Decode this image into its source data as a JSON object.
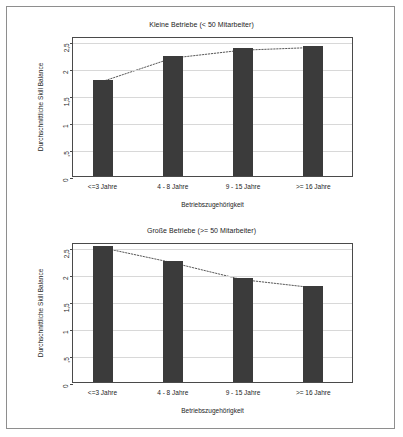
{
  "figure": {
    "background_color": "#ffffff",
    "frame_color": "#8e8e8e",
    "bar_color": "#3b3b3b",
    "grid_color": "#d8d8d8",
    "axis_color": "#4a4a4a"
  },
  "chart_data": [
    {
      "type": "bar",
      "title": "Kleine Betriebe (< 50 Mitarbeiter)",
      "xlabel": "Betriebszugehörigkeit",
      "ylabel": "Durchschnittliche Skill Balance",
      "categories": [
        "<=3  Jahre",
        "4 - 8   Jahre",
        "9 - 15   Jahre",
        ">= 16   Jahre"
      ],
      "values": [
        1.78,
        2.22,
        2.37,
        2.42
      ],
      "ylim": [
        0,
        2.6
      ],
      "yticks": [
        0,
        0.5,
        1,
        1.5,
        2,
        2.5
      ],
      "ytick_labels": [
        "0",
        ",5",
        "1",
        "1,5",
        "2",
        "2,5"
      ],
      "grid": true,
      "legend": "none",
      "overlay": {
        "type": "line",
        "style": "dotted",
        "values": [
          1.78,
          2.22,
          2.37,
          2.42
        ]
      }
    },
    {
      "type": "bar",
      "title": "Große Betriebe (>= 50 Mitarbeiter)",
      "xlabel": "Betriebszugehörigkeit",
      "ylabel": "Durchschnittliche Skill Balance",
      "categories": [
        "<=3  Jahre",
        "4 - 8   Jahre",
        "9 - 15   Jahre",
        ">= 16   Jahre"
      ],
      "values": [
        2.53,
        2.25,
        1.93,
        1.78
      ],
      "ylim": [
        0,
        2.6
      ],
      "yticks": [
        0,
        0.5,
        1,
        1.5,
        2,
        2.5
      ],
      "ytick_labels": [
        "0",
        ",5",
        "1",
        "1,5",
        "2",
        "2,5"
      ],
      "grid": true,
      "legend": "none",
      "overlay": {
        "type": "line",
        "style": "dotted",
        "values": [
          2.53,
          2.25,
          1.93,
          1.78
        ]
      }
    }
  ]
}
